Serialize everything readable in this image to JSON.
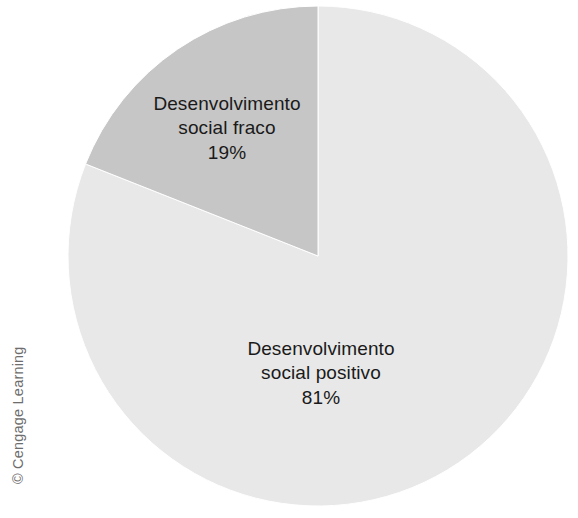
{
  "figure": {
    "background_color": "#ffffff",
    "credit": "© Cengage Learning"
  },
  "labels": {
    "fraco": {
      "line1": "Desenvolvimento",
      "line2": "social fraco",
      "percent": "19%"
    },
    "positivo": {
      "line1": "Desenvolvimento",
      "line2": "social positivo",
      "percent": "81%"
    }
  },
  "chart_data": {
    "type": "pie",
    "title": "",
    "labels": [
      "Desenvolvimento social positivo",
      "Desenvolvimento social fraco"
    ],
    "values": [
      81,
      19
    ],
    "value_labels": [
      "81%",
      "19%"
    ],
    "unit": "%",
    "colors": [
      "#e8e8e8",
      "#c6c6c6"
    ],
    "stroke_color": "#ffffff",
    "start_angle_deg": 0,
    "direction": "clockwise",
    "legend": "none",
    "grid": false,
    "center_px": [
      318,
      256
    ],
    "radius_px": 250
  }
}
